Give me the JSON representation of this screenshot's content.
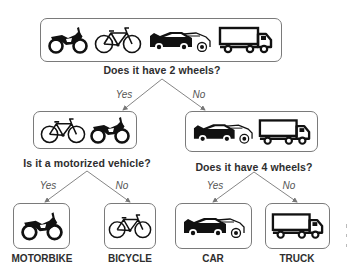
{
  "root": {
    "items": [
      "motorbike",
      "bicycle",
      "car",
      "truck"
    ],
    "question": "Does it have 2 wheels?"
  },
  "branches": {
    "root_yes": "Yes",
    "root_no": "No",
    "left_yes": "Yes",
    "left_no": "No",
    "right_yes": "Yes",
    "right_no": "No"
  },
  "left_node": {
    "items": [
      "bicycle",
      "motorbike"
    ],
    "question": "Is it a motorized vehicle?"
  },
  "right_node": {
    "items": [
      "car",
      "truck"
    ],
    "question": "Does it have 4 wheels?"
  },
  "leaves": [
    {
      "icon": "motorbike",
      "label": "MOTORBIKE"
    },
    {
      "icon": "bicycle",
      "label": "BICYCLE"
    },
    {
      "icon": "car",
      "label": "CAR"
    },
    {
      "icon": "truck",
      "label": "TRUCK"
    }
  ],
  "colors": {
    "border": "#7a7a7a",
    "arrow": "#777777",
    "icon": "#111111",
    "text": "#2e2e2e"
  }
}
